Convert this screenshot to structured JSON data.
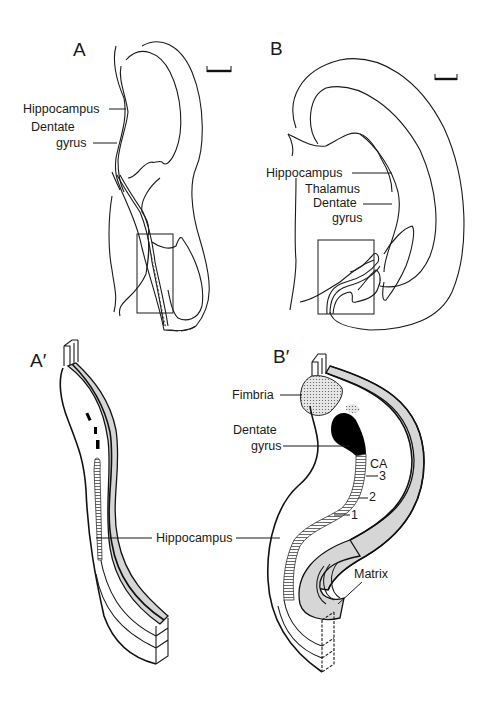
{
  "figure": {
    "panels": {
      "A": {
        "letter": "A",
        "labels": {
          "hippocampus": "Hippocampus",
          "dentate_1": "Dentate",
          "dentate_2": "gyrus"
        },
        "scale_bar": true
      },
      "B": {
        "letter": "B",
        "labels": {
          "hippocampus": "Hippocampus",
          "thalamus": "Thalamus",
          "dentate_1": "Dentate",
          "dentate_2": "gyrus"
        },
        "scale_bar": true
      },
      "A_prime": {
        "letter": "A′",
        "labels": {
          "hippocampus": "Hippocampus"
        }
      },
      "B_prime": {
        "letter": "B′",
        "labels": {
          "fimbria": "Fimbria",
          "dentate_1": "Dentate",
          "dentate_2": "gyrus",
          "ca": "CA",
          "ca3": "3",
          "ca2": "2",
          "ca1": "1",
          "matrix": "Matrix"
        }
      }
    },
    "colors": {
      "line": "#1a1a1a",
      "shade": "#d6d6d6",
      "dentate_fill": "#000000",
      "background": "#ffffff"
    }
  }
}
